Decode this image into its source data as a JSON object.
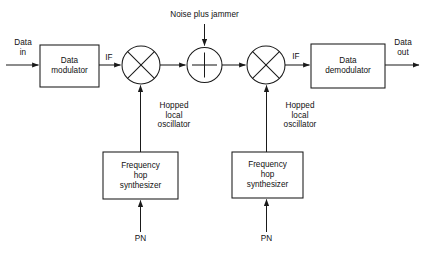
{
  "diagram": {
    "line_color": "#1a1a1a",
    "text_color": "#111111",
    "background": "#ffffff",
    "blocks": [
      {
        "id": "data-modulator",
        "label": "Data\nmodulator",
        "x": 40,
        "y": 45,
        "w": 59,
        "h": 42
      },
      {
        "id": "data-demodulator",
        "label": "Data\ndemodulator",
        "x": 311,
        "y": 44,
        "w": 74,
        "h": 44
      },
      {
        "id": "freq-hop-synth-tx",
        "label": "Frequency\nhop\nsynthesizer",
        "x": 103,
        "y": 152,
        "w": 75,
        "h": 47
      },
      {
        "id": "freq-hop-synth-rx",
        "label": "Frequency\nhop\nsynthesizer",
        "x": 232,
        "y": 152,
        "w": 71,
        "h": 46
      }
    ],
    "mixers": [
      {
        "id": "mixer-tx",
        "cx": 141,
        "cy": 65,
        "r": 19
      },
      {
        "id": "mixer-rx",
        "cx": 266,
        "cy": 65,
        "r": 19
      }
    ],
    "summers": [
      {
        "id": "summer-channel",
        "cx": 204.5,
        "cy": 65,
        "r": 17.5
      }
    ],
    "labels": [
      {
        "id": "data-in",
        "text": "Data\nin"
      },
      {
        "id": "if-left",
        "text": "IF"
      },
      {
        "id": "if-right",
        "text": "IF"
      },
      {
        "id": "data-out",
        "text": "Data\nout"
      },
      {
        "id": "noise-plus-jammer",
        "text": "Noise plus jammer"
      },
      {
        "id": "hopped-lo-tx",
        "text": "Hopped\nlocal\noscillator"
      },
      {
        "id": "hopped-lo-rx",
        "text": "Hopped\nlocal\noscillator"
      },
      {
        "id": "pn-tx",
        "text": "PN"
      },
      {
        "id": "pn-rx",
        "text": "PN"
      }
    ]
  },
  "text": {
    "data_in": "Data\nin",
    "data_out": "Data\nout",
    "if_left": "IF",
    "if_right": "IF",
    "noise_plus_jammer": "Noise plus jammer",
    "data_modulator": "Data\nmodulator",
    "data_demodulator": "Data\ndemodulator",
    "hopped_lo_tx": "Hopped\nlocal\noscillator",
    "hopped_lo_rx": "Hopped\nlocal\noscillator",
    "freq_hop_synth_tx": "Frequency\nhop\nsynthesizer",
    "freq_hop_synth_rx": "Frequency\nhop\nsynthesizer",
    "pn_tx": "PN",
    "pn_rx": "PN"
  }
}
